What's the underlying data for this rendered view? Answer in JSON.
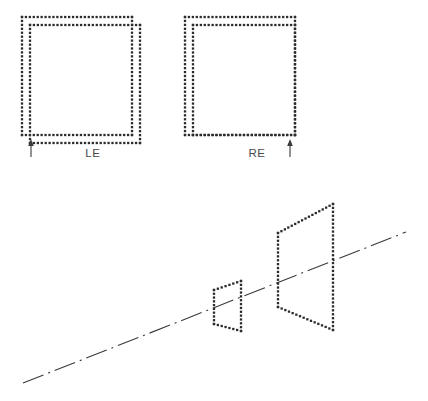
{
  "figure": {
    "background_color": "#ffffff",
    "dot_color": "#2b2b2b",
    "line_color": "#3a3a3a",
    "label_color": "#4a4a4a",
    "dot_size": 2.3,
    "dot_spacing": 4.0
  },
  "top_view": {
    "squares": [
      {
        "name": "left-eye-square",
        "label": "LE",
        "label_x": 93,
        "label_y": 157,
        "outer": {
          "x": 22,
          "y": 17,
          "w": 110,
          "h": 118
        },
        "inner": {
          "x": 30,
          "y": 25,
          "w": 110,
          "h": 118
        },
        "arrow": {
          "x": 31,
          "y_tip": 139,
          "y_tail": 157
        }
      },
      {
        "name": "right-eye-square",
        "label": "RE",
        "label_x": 257,
        "label_y": 157,
        "outer": {
          "x": 185,
          "y": 17,
          "w": 110,
          "h": 118
        },
        "inner": {
          "x": 193,
          "y": 25,
          "w": 102,
          "h": 110
        },
        "arrow": {
          "x": 290,
          "y_tip": 139,
          "y_tail": 157
        }
      }
    ]
  },
  "perspective_view": {
    "axis": {
      "name": "center-axis-line",
      "x1": 23,
      "y1": 383,
      "x2": 406,
      "y2": 232,
      "pattern": "dash-dot"
    },
    "near_frame": {
      "name": "small-trapezoid",
      "points": [
        [
          214,
          290
        ],
        [
          241,
          281
        ],
        [
          241,
          331
        ],
        [
          214,
          324
        ]
      ]
    },
    "far_frame": {
      "name": "large-trapezoid",
      "points": [
        [
          278,
          233
        ],
        [
          333,
          204
        ],
        [
          333,
          330
        ],
        [
          278,
          307
        ]
      ]
    }
  }
}
